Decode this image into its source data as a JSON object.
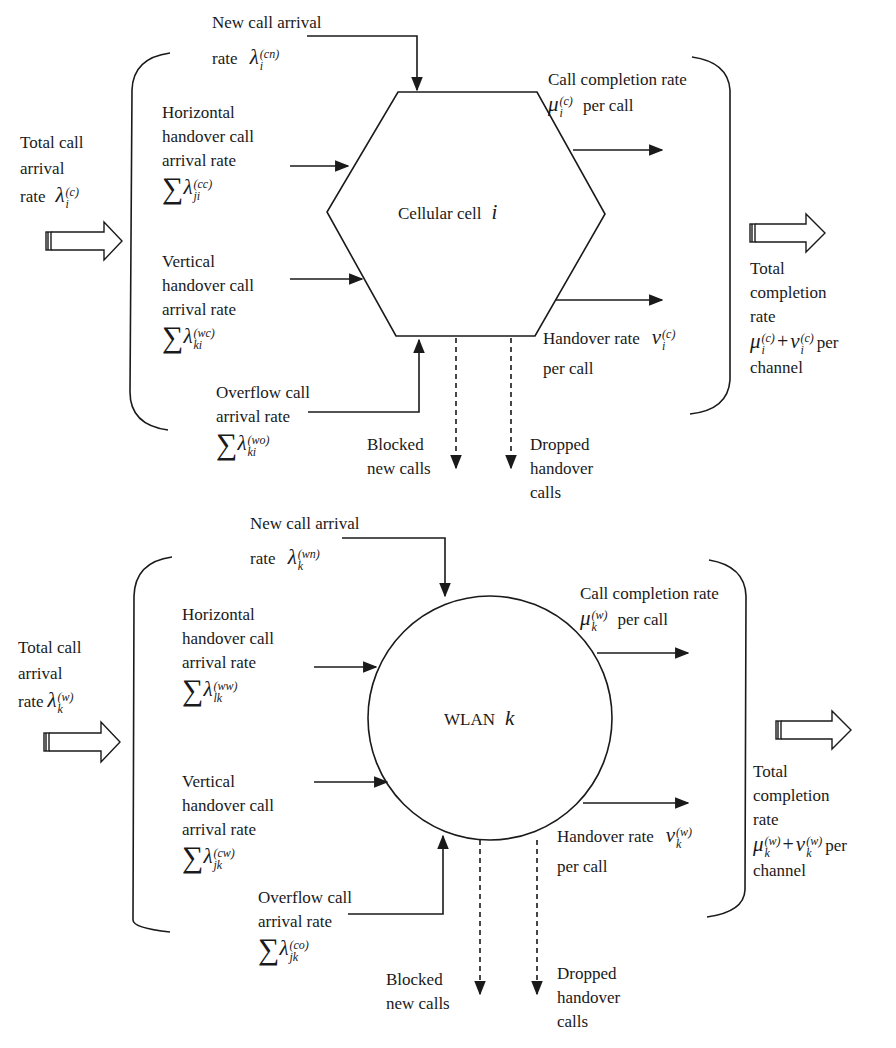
{
  "diagrams": [
    {
      "node": {
        "shape": "hexagon",
        "label": "Cellular cell",
        "index": "i"
      },
      "total_arrival": {
        "lines": [
          "Total call",
          "arrival",
          "rate"
        ],
        "symbol": "λ",
        "sup": "(c)",
        "sub": "i"
      },
      "new_call": {
        "lines": [
          "New call arrival",
          "rate"
        ],
        "symbol": "λ",
        "sup": "(cn)",
        "sub": "i"
      },
      "horizontal": {
        "lines": [
          "Horizontal",
          "handover call",
          "arrival rate"
        ],
        "symbol": "λ",
        "sup": "(cc)",
        "sub": "ji"
      },
      "vertical": {
        "lines": [
          "Vertical",
          "handover call",
          "arrival rate"
        ],
        "symbol": "λ",
        "sup": "(wc)",
        "sub": "ki"
      },
      "overflow": {
        "lines": [
          "Overflow call",
          "arrival rate"
        ],
        "symbol": "λ",
        "sup": "(wo)",
        "sub": "ki"
      },
      "completion": {
        "lines": [
          "Call completion rate",
          "per call"
        ],
        "symbol": "μ",
        "sup": "(c)",
        "sub": "i"
      },
      "handover": {
        "lines": [
          "Handover rate",
          "per call"
        ],
        "symbol": "ν",
        "sup": "(c)",
        "sub": "i"
      },
      "blocked": {
        "lines": [
          "Blocked",
          "new calls"
        ]
      },
      "dropped": {
        "lines": [
          "Dropped",
          "handover",
          "calls"
        ]
      },
      "total_completion": {
        "lines": [
          "Total",
          "completion",
          "rate",
          "per",
          "channel"
        ],
        "sym1": "μ",
        "sym2": "ν",
        "sup": "(c)",
        "sub": "i",
        "plus": "+"
      }
    },
    {
      "node": {
        "shape": "circle",
        "label": "WLAN",
        "index": "k"
      },
      "total_arrival": {
        "lines": [
          "Total call",
          "arrival",
          "rate"
        ],
        "symbol": "λ",
        "sup": "(w)",
        "sub": "k"
      },
      "new_call": {
        "lines": [
          "New call arrival",
          "rate"
        ],
        "symbol": "λ",
        "sup": "(wn)",
        "sub": "k"
      },
      "horizontal": {
        "lines": [
          "Horizontal",
          "handover call",
          "arrival rate"
        ],
        "symbol": "λ",
        "sup": "(ww)",
        "sub": "lk"
      },
      "vertical": {
        "lines": [
          "Vertical",
          "handover call",
          "arrival rate"
        ],
        "symbol": "λ",
        "sup": "(cw)",
        "sub": "jk"
      },
      "overflow": {
        "lines": [
          "Overflow call",
          "arrival rate"
        ],
        "symbol": "λ",
        "sup": "(co)",
        "sub": "jk"
      },
      "completion": {
        "lines": [
          "Call completion rate",
          "per call"
        ],
        "symbol": "μ",
        "sup": "(w)",
        "sub": "k"
      },
      "handover": {
        "lines": [
          "Handover rate",
          "per call"
        ],
        "symbol": "ν",
        "sup": "(w)",
        "sub": "k"
      },
      "blocked": {
        "lines": [
          "Blocked",
          "new calls"
        ]
      },
      "dropped": {
        "lines": [
          "Dropped",
          "handover",
          "calls"
        ]
      },
      "total_completion": {
        "lines": [
          "Total",
          "completion",
          "rate",
          "per",
          "channel"
        ],
        "sym1": "μ",
        "sym2": "ν",
        "sup": "(w)",
        "sub": "k",
        "plus": "+"
      }
    }
  ],
  "symbols": {
    "sum": "∑"
  }
}
